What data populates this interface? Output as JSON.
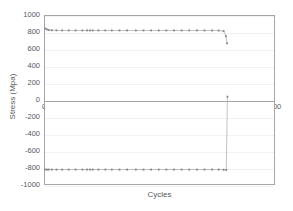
{
  "chart_data": {
    "type": "line",
    "title": "",
    "xlabel": "Cycles",
    "ylabel": "Stress (Mpa)",
    "xlim": [
      0,
      600
    ],
    "ylim": [
      -1000,
      1000
    ],
    "xticks": [
      0,
      100,
      200,
      300,
      400,
      500,
      600
    ],
    "yticks": [
      -1000,
      -800,
      -600,
      -400,
      -200,
      0,
      200,
      400,
      600,
      800,
      1000
    ],
    "xtick_labels": [
      "0",
      "100",
      "200",
      "300",
      "400",
      "500",
      "600"
    ],
    "ytick_labels": [
      "1000",
      "800",
      "600",
      "400",
      "200",
      "0",
      "-200",
      "-400",
      "-600",
      "-800",
      "-1000"
    ],
    "grid": "horizontal",
    "legend": "none",
    "marker": "square",
    "marker_color": "#808080",
    "line_color": "#9a9a9a",
    "series": [
      {
        "name": "Maximum stress",
        "x": [
          1,
          5,
          10,
          18,
          30,
          45,
          62,
          80,
          98,
          110,
          118,
          125,
          140,
          158,
          175,
          195,
          215,
          238,
          258,
          278,
          298,
          318,
          338,
          358,
          378,
          398,
          418,
          438,
          455,
          468,
          474,
          477
        ],
        "y": [
          851,
          840,
          833,
          830,
          829,
          828,
          828,
          828,
          828,
          828,
          828,
          828,
          828,
          828,
          828,
          828,
          828,
          828,
          828,
          828,
          828,
          828,
          828,
          828,
          828,
          828,
          828,
          828,
          827,
          820,
          760,
          675
        ]
      },
      {
        "name": "Minimum stress",
        "x": [
          1,
          5,
          10,
          18,
          30,
          45,
          62,
          80,
          98,
          110,
          118,
          125,
          140,
          158,
          175,
          195,
          215,
          238,
          258,
          278,
          298,
          318,
          338,
          358,
          378,
          398,
          418,
          438,
          455,
          468,
          475,
          478
        ],
        "y": [
          -828,
          -828,
          -828,
          -828,
          -828,
          -828,
          -828,
          -828,
          -828,
          -828,
          -828,
          -828,
          -828,
          -828,
          -828,
          -828,
          -828,
          -828,
          -828,
          -828,
          -828,
          -828,
          -828,
          -828,
          -828,
          -828,
          -828,
          -828,
          -828,
          -830,
          -832,
          40
        ]
      }
    ]
  }
}
